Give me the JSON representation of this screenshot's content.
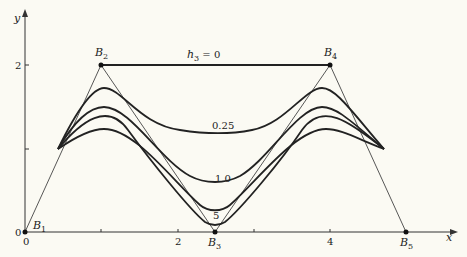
{
  "figure": {
    "axes": {
      "x_label": "x",
      "y_label": "y",
      "x_ticks": [
        "0",
        "2",
        "4"
      ],
      "y_ticks": [
        "0",
        "2"
      ],
      "origin_label": "0"
    },
    "control_points": [
      {
        "name": "B",
        "sub": "1",
        "x": 0,
        "y": 0
      },
      {
        "name": "B",
        "sub": "2",
        "x": 1,
        "y": 2
      },
      {
        "name": "B",
        "sub": "3",
        "x": 2.5,
        "y": 0
      },
      {
        "name": "B",
        "sub": "4",
        "x": 4,
        "y": 2
      },
      {
        "name": "B",
        "sub": "5",
        "x": 5,
        "y": 0
      }
    ],
    "curve_labels": {
      "h0": "h",
      "h0_sub": "3",
      "h0_value": " = 0",
      "h025": "0.25",
      "h1": "1.0",
      "h5": "5"
    },
    "colors": {
      "background": "#fbfaf3",
      "ink": "#222222"
    }
  }
}
